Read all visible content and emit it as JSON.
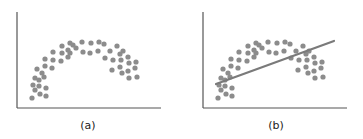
{
  "chart_data": [
    {
      "type": "scatter",
      "title": "",
      "caption": "(a)",
      "xlabel": "",
      "ylabel": "",
      "grid": false,
      "point_color": "#8c8c8c",
      "axis_color": "#555555",
      "points": [
        [
          32,
          98
        ],
        [
          35,
          90
        ],
        [
          33,
          85
        ],
        [
          39,
          86
        ],
        [
          46,
          88
        ],
        [
          46,
          96
        ],
        [
          40,
          94
        ],
        [
          35,
          78
        ],
        [
          39,
          80
        ],
        [
          44,
          77
        ],
        [
          42,
          73
        ],
        [
          37,
          69
        ],
        [
          45,
          66
        ],
        [
          45,
          59
        ],
        [
          52,
          68
        ],
        [
          53,
          60
        ],
        [
          53,
          52
        ],
        [
          61,
          61
        ],
        [
          62,
          53
        ],
        [
          62,
          46
        ],
        [
          68,
          57
        ],
        [
          70,
          53
        ],
        [
          68,
          50
        ],
        [
          70,
          43
        ],
        [
          73,
          45
        ],
        [
          76,
          48
        ],
        [
          82,
          42
        ],
        [
          83,
          52
        ],
        [
          90,
          53
        ],
        [
          91,
          43
        ],
        [
          98,
          51
        ],
        [
          99,
          42
        ],
        [
          104,
          44
        ],
        [
          110,
          51
        ],
        [
          105,
          58
        ],
        [
          117,
          46
        ],
        [
          113,
          60
        ],
        [
          120,
          54
        ],
        [
          123,
          51
        ],
        [
          121,
          60
        ],
        [
          112,
          70
        ],
        [
          120,
          67
        ],
        [
          128,
          57
        ],
        [
          129,
          63
        ],
        [
          136,
          62
        ],
        [
          122,
          73
        ],
        [
          128,
          71
        ],
        [
          135,
          68
        ],
        [
          129,
          78
        ],
        [
          137,
          77
        ]
      ]
    },
    {
      "type": "scatter",
      "title": "",
      "caption": "(b)",
      "xlabel": "",
      "ylabel": "",
      "grid": false,
      "point_color": "#8c8c8c",
      "axis_color": "#555555",
      "fit_line": {
        "type": "linear",
        "color": "#7a7a7a",
        "from": [
          30,
          84
        ],
        "to": [
          148,
          41
        ]
      },
      "points": [
        [
          32,
          98
        ],
        [
          35,
          90
        ],
        [
          33,
          85
        ],
        [
          39,
          86
        ],
        [
          46,
          88
        ],
        [
          46,
          96
        ],
        [
          40,
          94
        ],
        [
          35,
          78
        ],
        [
          39,
          80
        ],
        [
          44,
          77
        ],
        [
          42,
          73
        ],
        [
          37,
          69
        ],
        [
          45,
          66
        ],
        [
          45,
          59
        ],
        [
          52,
          68
        ],
        [
          53,
          60
        ],
        [
          53,
          52
        ],
        [
          61,
          61
        ],
        [
          62,
          53
        ],
        [
          62,
          46
        ],
        [
          68,
          57
        ],
        [
          70,
          53
        ],
        [
          68,
          50
        ],
        [
          70,
          43
        ],
        [
          73,
          45
        ],
        [
          76,
          48
        ],
        [
          82,
          42
        ],
        [
          83,
          52
        ],
        [
          90,
          53
        ],
        [
          91,
          43
        ],
        [
          98,
          51
        ],
        [
          99,
          42
        ],
        [
          104,
          44
        ],
        [
          110,
          51
        ],
        [
          105,
          58
        ],
        [
          117,
          46
        ],
        [
          113,
          60
        ],
        [
          120,
          54
        ],
        [
          123,
          51
        ],
        [
          121,
          60
        ],
        [
          112,
          70
        ],
        [
          120,
          67
        ],
        [
          128,
          57
        ],
        [
          129,
          63
        ],
        [
          136,
          62
        ],
        [
          122,
          73
        ],
        [
          128,
          71
        ],
        [
          135,
          68
        ],
        [
          129,
          78
        ],
        [
          137,
          77
        ]
      ]
    }
  ]
}
